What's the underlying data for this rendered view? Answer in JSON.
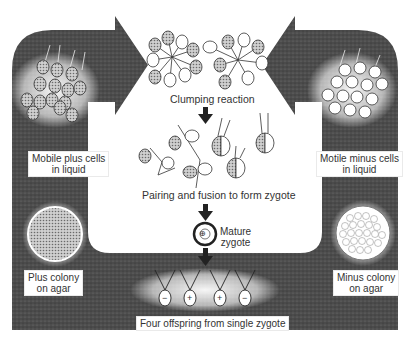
{
  "diagram": {
    "labels": {
      "plus_cells": [
        "Mobile plus cells",
        "in liquid"
      ],
      "minus_cells": [
        "Motile minus cells",
        "in liquid"
      ],
      "clumping": "Clumping reaction",
      "pairing": "Pairing and fusion to form zygote",
      "mature_zygote": [
        "Mature",
        "zygote"
      ],
      "plus_colony": [
        "Plus colony",
        "on agar"
      ],
      "minus_colony": [
        "Minus colony",
        "on agar"
      ],
      "offspring": "Four offspring from single zygote"
    },
    "symbols": {
      "zygote_mark": "⊕",
      "offspring_marks": [
        "−",
        "+",
        "+",
        "−"
      ]
    },
    "colors": {
      "frame": "#4a4a4a",
      "frame_light": "#6a6a6a",
      "background": "#ffffff",
      "hatched_cell": "#9a9a9a",
      "text": "#333333"
    },
    "stages": [
      {
        "id": "plus-cells",
        "label_ref": "plus_cells"
      },
      {
        "id": "minus-cells",
        "label_ref": "minus_cells"
      },
      {
        "id": "clumping",
        "label_ref": "clumping"
      },
      {
        "id": "pairing",
        "label_ref": "pairing"
      },
      {
        "id": "mature-zygote",
        "label_ref": "mature_zygote"
      },
      {
        "id": "offspring",
        "label_ref": "offspring"
      },
      {
        "id": "plus-colony",
        "label_ref": "plus_colony"
      },
      {
        "id": "minus-colony",
        "label_ref": "minus_colony"
      }
    ]
  }
}
